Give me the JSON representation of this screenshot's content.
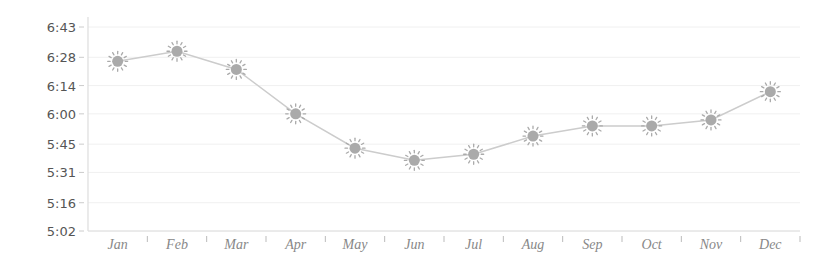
{
  "chart_data": {
    "type": "line",
    "title": "",
    "xlabel": "",
    "ylabel": "",
    "categories": [
      "Jan",
      "Feb",
      "Mar",
      "Apr",
      "May",
      "Jun",
      "Jul",
      "Aug",
      "Sep",
      "Oct",
      "Nov",
      "Dec"
    ],
    "series": [
      {
        "name": "Sunrise time",
        "marker": "sun-icon",
        "values_label": [
          "6:26",
          "6:31",
          "6:22",
          "6:00",
          "5:43",
          "5:37",
          "5:40",
          "5:49",
          "5:54",
          "5:54",
          "5:57",
          "6:11"
        ],
        "values_minutes": [
          386,
          391,
          382,
          360,
          343,
          337,
          340,
          349,
          354,
          354,
          357,
          371
        ]
      }
    ],
    "y_ticks": [
      "5:02",
      "5:16",
      "5:31",
      "5:45",
      "6:00",
      "6:14",
      "6:28",
      "6:43"
    ],
    "y_ticks_minutes": [
      302,
      316,
      331,
      345,
      360,
      374,
      388,
      403
    ],
    "ylim_minutes": [
      302,
      403
    ],
    "grid": true,
    "legend": null
  },
  "colors": {
    "line": "#cccccc",
    "marker_fill": "#aaaaaa",
    "marker_rays": "#aaaaaa",
    "grid": "#f0f0f0",
    "axis": "#dddddd",
    "ytick_text": "#555555",
    "xtick_text": "#888888"
  }
}
